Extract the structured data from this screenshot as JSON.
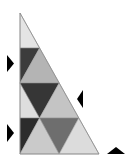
{
  "diagram": {
    "type": "triangle-tiling-puzzle",
    "outline": {
      "points": "20,13 20,154 99,154",
      "stroke": "#8a8a8a"
    },
    "tiles": [
      {
        "name": "tile-apex",
        "points": "20,13 39.6,48 20,48",
        "fill": "#e4e4e4"
      },
      {
        "name": "tile-r2-dark-left",
        "points": "20,48 39.6,48 20,83",
        "fill": "#3c3c3c"
      },
      {
        "name": "tile-r2-mid-up",
        "points": "20,83 39.6,48 59.2,83",
        "fill": "#b4b4b4"
      },
      {
        "name": "tile-r3-light-left",
        "points": "20,83 39.6,118 20,118",
        "fill": "#dedede"
      },
      {
        "name": "tile-r3-dark-down",
        "points": "20,83 59.2,83 39.6,118",
        "fill": "#363636"
      },
      {
        "name": "tile-r3-mid-up",
        "points": "39.6,118 59.2,83 78.8,118",
        "fill": "#c4c4c4"
      },
      {
        "name": "tile-r4-dark-left",
        "points": "20,118 39.6,118 20,154",
        "fill": "#2c2c2c"
      },
      {
        "name": "tile-r4-light-up",
        "points": "20,154 39.6,118 59.2,154",
        "fill": "#cacaca"
      },
      {
        "name": "tile-r4-grey-down",
        "points": "39.6,118 78.8,118 59.2,154",
        "fill": "#6e6e6e"
      },
      {
        "name": "tile-r4-lighter-up",
        "points": "59.2,154 78.8,118 99,154",
        "fill": "#dcdcdc"
      }
    ],
    "markers": [
      {
        "name": "arrow-right-icon",
        "points": "7,55 14,63.5 7,72",
        "fill": "#000000"
      },
      {
        "name": "arrow-left-icon",
        "points": "83,90 77,99 83,108",
        "fill": "#000000"
      },
      {
        "name": "arrow-right-icon",
        "points": "7,124 14,133 7,142",
        "fill": "#000000"
      },
      {
        "name": "arrow-up-icon",
        "points": "107,154 116,147 125,154",
        "fill": "#000000"
      }
    ]
  }
}
